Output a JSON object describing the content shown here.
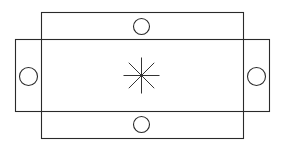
{
  "diagram": {
    "width": 285,
    "height": 145,
    "stroke_color": "#2a2a2a",
    "background": "#ffffff",
    "rectangles": [
      {
        "name": "vertical-rectangle",
        "x": 41,
        "y": 12,
        "width": 202,
        "height": 126
      },
      {
        "name": "horizontal-rectangle",
        "x": 15,
        "y": 39,
        "width": 254,
        "height": 72
      }
    ],
    "circles": [
      {
        "name": "top-circle",
        "cx": 141,
        "cy": 26,
        "r": 8
      },
      {
        "name": "bottom-circle",
        "cx": 141,
        "cy": 124,
        "r": 8
      },
      {
        "name": "left-circle",
        "cx": 28,
        "cy": 76,
        "r": 9
      },
      {
        "name": "right-circle",
        "cx": 256,
        "cy": 76,
        "r": 9
      }
    ],
    "center_mark": {
      "name": "asterisk-center-mark",
      "cx": 141,
      "cy": 75,
      "r": 18,
      "rays": 8
    }
  }
}
